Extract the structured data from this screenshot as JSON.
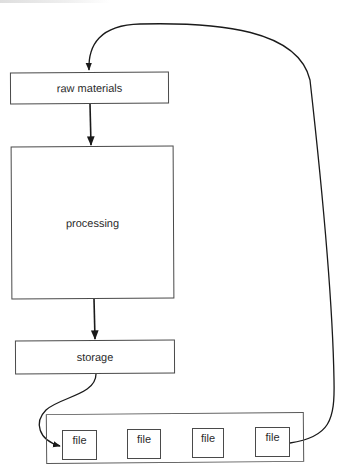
{
  "diagram": {
    "type": "flowchart",
    "nodes": [
      {
        "id": "raw",
        "label": "raw materials"
      },
      {
        "id": "processing",
        "label": "processing"
      },
      {
        "id": "storage",
        "label": "storage"
      },
      {
        "id": "files",
        "label": "",
        "children": [
          {
            "id": "file1",
            "label": "file"
          },
          {
            "id": "file2",
            "label": "file"
          },
          {
            "id": "file3",
            "label": "file"
          },
          {
            "id": "file4",
            "label": "file"
          }
        ]
      }
    ],
    "edges": [
      {
        "from": "raw",
        "to": "processing",
        "style": "straight-arrow"
      },
      {
        "from": "processing",
        "to": "storage",
        "style": "straight-arrow"
      },
      {
        "from": "storage",
        "to": "file1",
        "style": "curved-arrow"
      },
      {
        "from": "file4",
        "to": "raw",
        "style": "curved-arrow-loop"
      }
    ],
    "line_color": "#1a1a1a",
    "box_border_color": "#4a4a4a",
    "text_color": "#2b2b2b"
  }
}
